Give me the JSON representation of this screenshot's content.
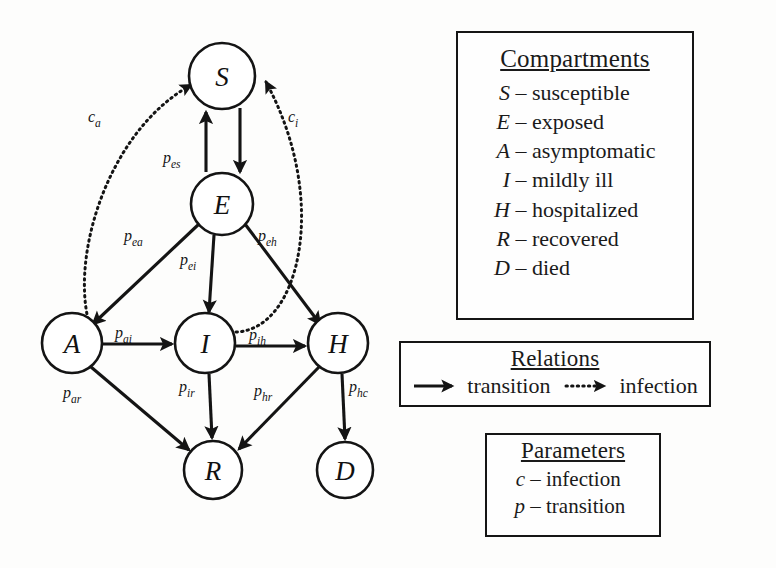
{
  "diagram": {
    "nodes": [
      {
        "id": "S",
        "label": "S",
        "cx": 222,
        "cy": 76,
        "r": 33
      },
      {
        "id": "E",
        "label": "E",
        "cx": 222,
        "cy": 204,
        "r": 31
      },
      {
        "id": "A",
        "label": "A",
        "cx": 72,
        "cy": 343,
        "r": 30
      },
      {
        "id": "I",
        "label": "I",
        "cx": 205,
        "cy": 343,
        "r": 30
      },
      {
        "id": "H",
        "label": "H",
        "cx": 338,
        "cy": 343,
        "r": 30
      },
      {
        "id": "R",
        "label": "R",
        "cx": 213,
        "cy": 470,
        "r": 29
      },
      {
        "id": "D",
        "label": "D",
        "cx": 345,
        "cy": 470,
        "r": 28
      }
    ],
    "edges": [
      {
        "id": "es",
        "from": "E",
        "to": "S",
        "kind": "transition",
        "base": "p",
        "sub": "es",
        "path": "M 206 172 L 206 112",
        "label_x": 163,
        "label_y": 163
      },
      {
        "id": "se",
        "from": "S",
        "to": "E",
        "kind": "transition",
        "base": "",
        "sub": "",
        "path": "M 240 108 L 240 172",
        "label_x": 0,
        "label_y": 0
      },
      {
        "id": "ea",
        "from": "E",
        "to": "A",
        "kind": "transition",
        "base": "p",
        "sub": "ea",
        "path": "M 199 224 L 93 324",
        "label_x": 124,
        "label_y": 241
      },
      {
        "id": "ei",
        "from": "E",
        "to": "I",
        "kind": "transition",
        "base": "p",
        "sub": "ei",
        "path": "M 214 235 L 209 312",
        "label_x": 180,
        "label_y": 265
      },
      {
        "id": "eh",
        "from": "E",
        "to": "H",
        "kind": "transition",
        "base": "p",
        "sub": "eh",
        "path": "M 245 224 L 320 324",
        "label_x": 258,
        "label_y": 241
      },
      {
        "id": "ai",
        "from": "A",
        "to": "I",
        "kind": "transition",
        "base": "p",
        "sub": "ai",
        "path": "M 103 344 L 172 344",
        "label_x": 115,
        "label_y": 338
      },
      {
        "id": "ih",
        "from": "I",
        "to": "H",
        "kind": "transition",
        "base": "p",
        "sub": "ih",
        "path": "M 236 346 L 305 346",
        "label_x": 249,
        "label_y": 340
      },
      {
        "id": "ar",
        "from": "A",
        "to": "R",
        "kind": "transition",
        "base": "p",
        "sub": "ar",
        "path": "M 91 367 L 189 450",
        "label_x": 63,
        "label_y": 398
      },
      {
        "id": "ir",
        "from": "I",
        "to": "R",
        "kind": "transition",
        "base": "p",
        "sub": "ir",
        "path": "M 209 374 L 212 438",
        "label_x": 179,
        "label_y": 392
      },
      {
        "id": "hr",
        "from": "H",
        "to": "R",
        "kind": "transition",
        "base": "p",
        "sub": "hr",
        "path": "M 319 367 L 239 449",
        "label_x": 254,
        "label_y": 396
      },
      {
        "id": "hc",
        "from": "H",
        "to": "D",
        "kind": "transition",
        "base": "p",
        "sub": "hc",
        "path": "M 342 374 L 345 439",
        "label_x": 349,
        "label_y": 392
      },
      {
        "id": "ca",
        "from": "A",
        "to": "S",
        "kind": "infection",
        "base": "c",
        "sub": "a",
        "path": "M 88 319 C 72 250 110 130 191 85",
        "label_x": 88,
        "label_y": 122
      },
      {
        "id": "ci",
        "from": "I",
        "to": "S",
        "kind": "infection",
        "base": "c",
        "sub": "i",
        "path": "M 236 332 C 300 330 330 200 266 82",
        "label_x": 288,
        "label_y": 122
      }
    ]
  },
  "panels": {
    "compartments": {
      "title": "Compartments",
      "rows": [
        {
          "symbol": "S",
          "dash": "–",
          "text": "susceptible"
        },
        {
          "symbol": "E",
          "dash": "–",
          "text": "exposed"
        },
        {
          "symbol": "A",
          "dash": "–",
          "text": "asymptomatic"
        },
        {
          "symbol": "I",
          "dash": "–",
          "text": "mildly ill"
        },
        {
          "symbol": "H",
          "dash": "–",
          "text": "hospitalized"
        },
        {
          "symbol": "R",
          "dash": "–",
          "text": "recovered"
        },
        {
          "symbol": "D",
          "dash": "–",
          "text": "died"
        }
      ]
    },
    "relations": {
      "title": "Relations",
      "items": [
        {
          "style": "solid",
          "label": "transition"
        },
        {
          "style": "dotted",
          "label": "infection"
        }
      ]
    },
    "parameters": {
      "title": "Parameters",
      "rows": [
        {
          "symbol": "c",
          "dash": "–",
          "text": "infection"
        },
        {
          "symbol": "p",
          "dash": "–",
          "text": "transition"
        }
      ]
    }
  }
}
